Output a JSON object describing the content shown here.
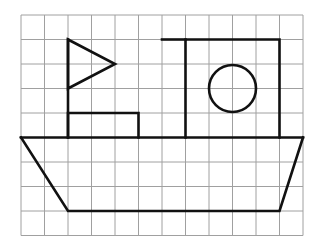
{
  "grid": {
    "origin_x": 21,
    "origin_y": 15,
    "cols": 12,
    "rows": 9,
    "cell_w": 23.5,
    "cell_h": 24.5,
    "line_color": "#a0a0a0",
    "line_width": 1
  },
  "shape_style": {
    "stroke": "#111111",
    "stroke_width": 2.6
  },
  "shapes": {
    "flag_pole": {
      "points": [
        [
          2,
          1
        ],
        [
          2,
          5
        ]
      ]
    },
    "flag_triangle": {
      "points": [
        [
          2,
          1
        ],
        [
          4,
          2
        ],
        [
          2,
          3
        ]
      ]
    },
    "small_rectangle": {
      "points": [
        [
          2,
          5
        ],
        [
          2,
          4
        ],
        [
          5,
          4
        ],
        [
          5,
          5
        ]
      ]
    },
    "cabin": {
      "points": [
        [
          7,
          5
        ],
        [
          7,
          1
        ],
        [
          11,
          1
        ],
        [
          11,
          5
        ]
      ],
      "top_extends_from": [
        6,
        1
      ]
    },
    "porthole": {
      "cx": 9,
      "cy": 3,
      "r": 1
    },
    "deck_line": {
      "points": [
        [
          0,
          5
        ],
        [
          12,
          5
        ]
      ]
    },
    "hull": {
      "points": [
        [
          0,
          5
        ],
        [
          2,
          8
        ],
        [
          11,
          8
        ],
        [
          12,
          5
        ]
      ]
    }
  }
}
